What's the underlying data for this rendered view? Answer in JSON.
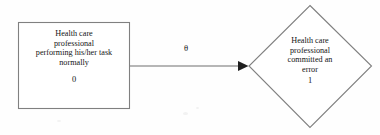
{
  "diagram": {
    "type": "state-transition",
    "states": [
      {
        "id": "normal",
        "shape": "rectangle",
        "lines": [
          "Health care",
          "professional",
          "performing his/her task",
          "normally"
        ],
        "code": "0"
      },
      {
        "id": "error",
        "shape": "diamond",
        "lines": [
          "Health care",
          "professional",
          "committed an",
          "error"
        ],
        "code": "1"
      }
    ],
    "transitions": [
      {
        "from": "normal",
        "to": "error",
        "label": "θ",
        "direction": "right"
      }
    ],
    "colors": {
      "stroke": "#808080",
      "arrow": "#6e6e6e",
      "text": "#141414",
      "background": "#fefefe"
    }
  }
}
